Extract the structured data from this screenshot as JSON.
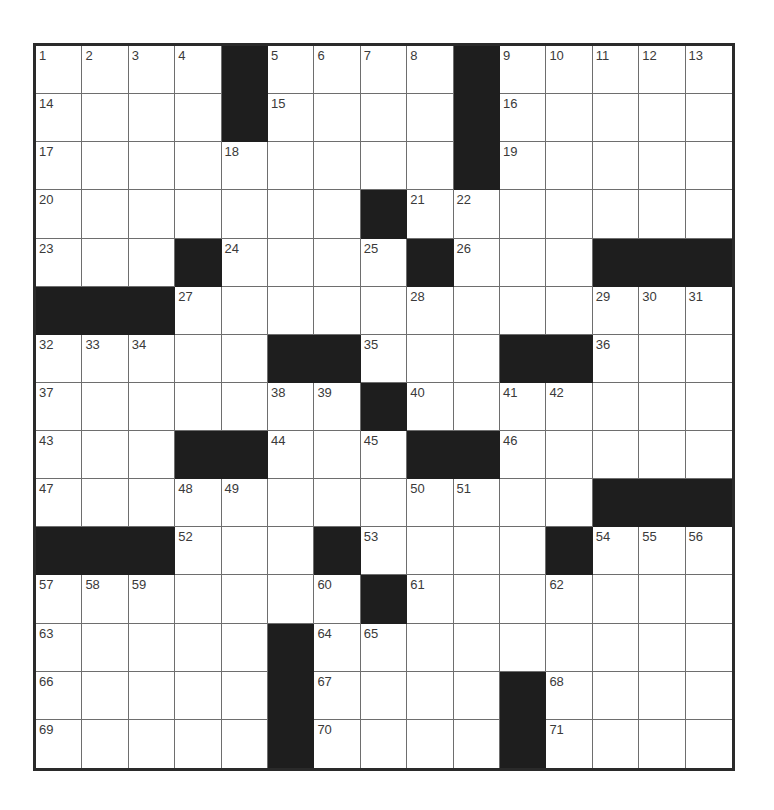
{
  "puzzle": {
    "rows": 15,
    "cols": 15,
    "colors": {
      "block": "#1e1e1e",
      "cell": "#ffffff",
      "border": "#2a2a2a",
      "gridline": "#6e6e6e",
      "number": "#3a3a3a"
    },
    "layout": [
      "....#....#.....",
      "....#....#.....",
      ".........#.....",
      ".......#.......",
      "...#....#...###",
      "###............",
      ".....##...##...",
      ".......#.......",
      "...##...##.....",
      "............###",
      "###...#....#...",
      ".......#.......",
      ".....#.........",
      ".....#....#....",
      ".....#....#...."
    ],
    "numbers": [
      {
        "r": 0,
        "c": 0,
        "n": "1"
      },
      {
        "r": 0,
        "c": 1,
        "n": "2"
      },
      {
        "r": 0,
        "c": 2,
        "n": "3"
      },
      {
        "r": 0,
        "c": 3,
        "n": "4"
      },
      {
        "r": 0,
        "c": 5,
        "n": "5"
      },
      {
        "r": 0,
        "c": 6,
        "n": "6"
      },
      {
        "r": 0,
        "c": 7,
        "n": "7"
      },
      {
        "r": 0,
        "c": 8,
        "n": "8"
      },
      {
        "r": 0,
        "c": 10,
        "n": "9"
      },
      {
        "r": 0,
        "c": 11,
        "n": "10"
      },
      {
        "r": 0,
        "c": 12,
        "n": "11"
      },
      {
        "r": 0,
        "c": 13,
        "n": "12"
      },
      {
        "r": 0,
        "c": 14,
        "n": "13"
      },
      {
        "r": 1,
        "c": 0,
        "n": "14"
      },
      {
        "r": 1,
        "c": 5,
        "n": "15"
      },
      {
        "r": 1,
        "c": 10,
        "n": "16"
      },
      {
        "r": 2,
        "c": 0,
        "n": "17"
      },
      {
        "r": 2,
        "c": 4,
        "n": "18"
      },
      {
        "r": 2,
        "c": 10,
        "n": "19"
      },
      {
        "r": 3,
        "c": 0,
        "n": "20"
      },
      {
        "r": 3,
        "c": 8,
        "n": "21"
      },
      {
        "r": 3,
        "c": 9,
        "n": "22"
      },
      {
        "r": 4,
        "c": 0,
        "n": "23"
      },
      {
        "r": 4,
        "c": 4,
        "n": "24"
      },
      {
        "r": 4,
        "c": 7,
        "n": "25"
      },
      {
        "r": 4,
        "c": 9,
        "n": "26"
      },
      {
        "r": 5,
        "c": 3,
        "n": "27"
      },
      {
        "r": 5,
        "c": 8,
        "n": "28"
      },
      {
        "r": 5,
        "c": 12,
        "n": "29"
      },
      {
        "r": 5,
        "c": 13,
        "n": "30"
      },
      {
        "r": 5,
        "c": 14,
        "n": "31"
      },
      {
        "r": 6,
        "c": 0,
        "n": "32"
      },
      {
        "r": 6,
        "c": 1,
        "n": "33"
      },
      {
        "r": 6,
        "c": 2,
        "n": "34"
      },
      {
        "r": 6,
        "c": 7,
        "n": "35"
      },
      {
        "r": 6,
        "c": 12,
        "n": "36"
      },
      {
        "r": 7,
        "c": 0,
        "n": "37"
      },
      {
        "r": 7,
        "c": 5,
        "n": "38"
      },
      {
        "r": 7,
        "c": 6,
        "n": "39"
      },
      {
        "r": 7,
        "c": 8,
        "n": "40"
      },
      {
        "r": 7,
        "c": 10,
        "n": "41"
      },
      {
        "r": 7,
        "c": 11,
        "n": "42"
      },
      {
        "r": 8,
        "c": 0,
        "n": "43"
      },
      {
        "r": 8,
        "c": 5,
        "n": "44"
      },
      {
        "r": 8,
        "c": 7,
        "n": "45"
      },
      {
        "r": 8,
        "c": 10,
        "n": "46"
      },
      {
        "r": 9,
        "c": 0,
        "n": "47"
      },
      {
        "r": 9,
        "c": 3,
        "n": "48"
      },
      {
        "r": 9,
        "c": 4,
        "n": "49"
      },
      {
        "r": 9,
        "c": 8,
        "n": "50"
      },
      {
        "r": 9,
        "c": 9,
        "n": "51"
      },
      {
        "r": 10,
        "c": 3,
        "n": "52"
      },
      {
        "r": 10,
        "c": 7,
        "n": "53"
      },
      {
        "r": 10,
        "c": 12,
        "n": "54"
      },
      {
        "r": 10,
        "c": 13,
        "n": "55"
      },
      {
        "r": 10,
        "c": 14,
        "n": "56"
      },
      {
        "r": 11,
        "c": 0,
        "n": "57"
      },
      {
        "r": 11,
        "c": 1,
        "n": "58"
      },
      {
        "r": 11,
        "c": 2,
        "n": "59"
      },
      {
        "r": 11,
        "c": 6,
        "n": "60"
      },
      {
        "r": 11,
        "c": 8,
        "n": "61"
      },
      {
        "r": 11,
        "c": 11,
        "n": "62"
      },
      {
        "r": 12,
        "c": 0,
        "n": "63"
      },
      {
        "r": 12,
        "c": 6,
        "n": "64"
      },
      {
        "r": 12,
        "c": 7,
        "n": "65"
      },
      {
        "r": 13,
        "c": 0,
        "n": "66"
      },
      {
        "r": 13,
        "c": 6,
        "n": "67"
      },
      {
        "r": 13,
        "c": 11,
        "n": "68"
      },
      {
        "r": 14,
        "c": 0,
        "n": "69"
      },
      {
        "r": 14,
        "c": 6,
        "n": "70"
      },
      {
        "r": 14,
        "c": 11,
        "n": "71"
      }
    ],
    "entries": []
  }
}
